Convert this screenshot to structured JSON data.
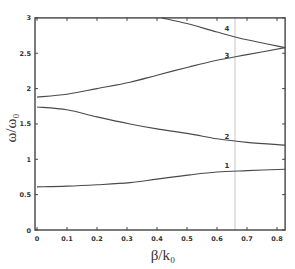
{
  "chart_data": {
    "type": "line",
    "title": "",
    "xlabel": "β/k₀",
    "ylabel": "ω/ω₀",
    "xlim": [
      0,
      0.827
    ],
    "ylim": [
      0,
      3
    ],
    "grid": false,
    "legend": "none (curves labeled inline 1-4)",
    "x_ticks": [
      "0",
      "0.1",
      "0.2",
      "0.3",
      "0.4",
      "0.5",
      "0.6",
      "0.7",
      "0.8"
    ],
    "y_ticks": [
      "0",
      "0.5",
      "1",
      "1.5",
      "2",
      "2.5",
      "3"
    ],
    "vertical_marker": {
      "x": 0.66,
      "style": "thin gray line"
    },
    "series": [
      {
        "name": "1",
        "x": [
          0,
          0.1,
          0.2,
          0.31,
          0.4,
          0.51,
          0.6,
          0.7,
          0.827
        ],
        "values": [
          0.61,
          0.62,
          0.64,
          0.67,
          0.72,
          0.78,
          0.82,
          0.84,
          0.86
        ]
      },
      {
        "name": "2",
        "x": [
          0,
          0.1,
          0.2,
          0.31,
          0.4,
          0.51,
          0.6,
          0.7,
          0.827
        ],
        "values": [
          1.74,
          1.7,
          1.6,
          1.5,
          1.43,
          1.36,
          1.29,
          1.24,
          1.2
        ]
      },
      {
        "name": "3",
        "x": [
          0,
          0.1,
          0.2,
          0.31,
          0.4,
          0.51,
          0.6,
          0.7,
          0.827
        ],
        "values": [
          1.88,
          1.92,
          2.0,
          2.09,
          2.19,
          2.31,
          2.4,
          2.48,
          2.58
        ]
      },
      {
        "name": "4",
        "x": [
          0.417,
          0.5,
          0.6,
          0.7,
          0.827
        ],
        "values": [
          3.0,
          2.92,
          2.8,
          2.69,
          2.58
        ]
      }
    ]
  },
  "labels": {
    "xlabel": "β/k₀",
    "ylabel": "ω/ω₀",
    "curve_labels": [
      {
        "text": "4",
        "x": 0.65,
        "y": 2.81
      },
      {
        "text": "3",
        "x": 0.65,
        "y": 2.43
      },
      {
        "text": "2",
        "x": 0.65,
        "y": 1.29
      },
      {
        "text": "1",
        "x": 0.65,
        "y": 0.87
      }
    ]
  }
}
